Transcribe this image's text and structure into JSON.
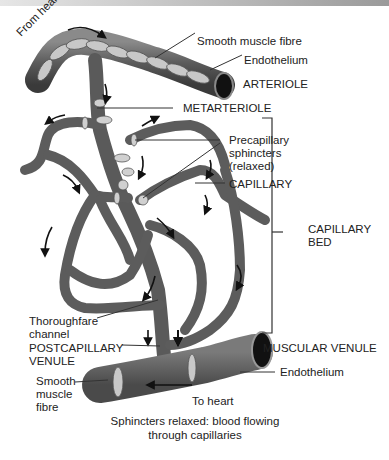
{
  "diagram": {
    "labels": {
      "from_heart": "From heart",
      "smooth_muscle_fibre_top": "Smooth muscle fibre",
      "endothelium_top": "Endothelium",
      "arteriole": "ARTERIOLE",
      "metarteriole": "METARTERIOLE",
      "precapillary_sphincters": [
        "Precapillary",
        "sphincters",
        "(relaxed)"
      ],
      "capillary": "CAPILLARY",
      "capillary_bed": [
        "CAPILLARY",
        "BED"
      ],
      "thoroughfare_channel": [
        "Thoroughfare",
        "channel"
      ],
      "postcapillary_venule": [
        "POSTCAPILLARY",
        "VENULE"
      ],
      "muscular_venule": "MUSCULAR VENULE",
      "endothelium_bottom": "Endothelium",
      "smooth_muscle_fibre_bottom": [
        "Smooth",
        "muscle",
        "fibre"
      ],
      "to_heart": "To heart"
    },
    "caption": [
      "Sphincters relaxed: blood flowing",
      "through capillaries"
    ],
    "colors": {
      "vessel": "#5a5a5a",
      "vessel_edge": "#3a3a3a",
      "sphincter": "#d0d0d0",
      "lumen": "#1a1a1a"
    }
  }
}
